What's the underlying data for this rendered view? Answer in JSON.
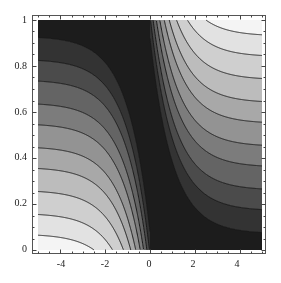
{
  "chart_data": {
    "type": "heatmap",
    "subtype": "contour",
    "title": "",
    "xlabel": "",
    "ylabel": "",
    "xlim": [
      -5,
      5
    ],
    "ylim": [
      0,
      1
    ],
    "x_ticks": [
      -4,
      -2,
      0,
      2,
      4
    ],
    "y_ticks": [
      0,
      0.2,
      0.4,
      0.6,
      0.8,
      1
    ],
    "x_tick_labels": [
      "-4",
      "-2",
      "0",
      "2",
      "4"
    ],
    "y_tick_labels": [
      "0",
      "0.2",
      "0.4",
      "0.6",
      "0.8",
      "1"
    ],
    "grid": false,
    "legend": null,
    "model": "x<0: f = y + 0.85*exp(x); x>0: f = 0.85*exp(-x) - y + 1 (mirror)",
    "amplitude": 0.85,
    "contour_levels": [
      0.07,
      0.16,
      0.26,
      0.36,
      0.45,
      0.55,
      0.64,
      0.74,
      0.83,
      0.93
    ],
    "left_contour_y_at_x_min": [
      0.07,
      0.16,
      0.25,
      0.35,
      0.45,
      0.55,
      0.64,
      0.73,
      0.83
    ],
    "right_contour_y_at_x_max": [
      0.93,
      0.83,
      0.74,
      0.64,
      0.55,
      0.45,
      0.36,
      0.27,
      0.17
    ],
    "shading": "light = low value (bottom-left & top-right), dark near x=0",
    "band_colors": [
      "#f4f4f4",
      "#e2e2e2",
      "#cfcfcf",
      "#bcbcbc",
      "#a8a8a8",
      "#939393",
      "#7c7c7c",
      "#646464",
      "#4b4b4b",
      "#333333",
      "#1c1c1c"
    ],
    "line_color": "#1a1a1a"
  },
  "axes": {
    "y_labels": [
      "1",
      "0.8",
      "0.6",
      "0.4",
      "0.2",
      "0"
    ],
    "x_labels": [
      "-4",
      "-2",
      "0",
      "2",
      "4"
    ]
  }
}
